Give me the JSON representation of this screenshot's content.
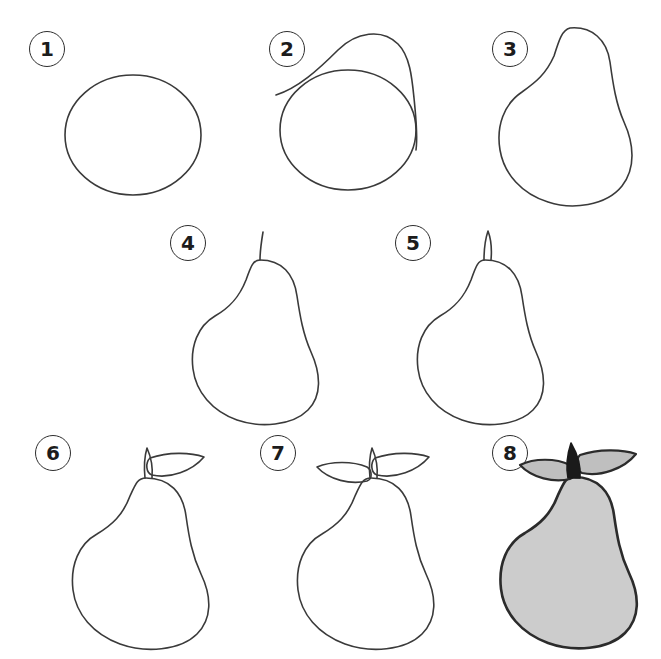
{
  "sheet": {
    "title": "How to Draw a Pear",
    "background_color": "#ffffff",
    "ink_color": "#3a3a3a",
    "fill_gray": "#cccccc",
    "leaf_gray": "#bfbfbf",
    "stem_dark": "#1a1a1a",
    "total_steps": 8,
    "columns_row1": 3,
    "columns_row2": 2,
    "columns_row3": 3
  },
  "steps": [
    {
      "number": "1",
      "name": "step-1",
      "description": "Draw a large circle for the body of the pear.",
      "elements": [
        "circle"
      ],
      "filled": "no"
    },
    {
      "number": "2",
      "name": "step-2",
      "description": "Add a rounded dome shape overlapping the top of the circle for the neck.",
      "elements": [
        "circle",
        "neck-dome"
      ],
      "filled": "no"
    },
    {
      "number": "3",
      "name": "step-3",
      "description": "Merge the two shapes into one smooth pear outline and erase guide lines.",
      "elements": [
        "pear-outline"
      ],
      "filled": "no"
    },
    {
      "number": "4",
      "name": "step-4",
      "description": "Draw a thin line rising from the top of the pear for the stem.",
      "elements": [
        "pear-outline",
        "stem-line"
      ],
      "filled": "no"
    },
    {
      "number": "5",
      "name": "step-5",
      "description": "Thicken the stem into a narrow outlined shape.",
      "elements": [
        "pear-outline",
        "stem-outline"
      ],
      "filled": "no"
    },
    {
      "number": "6",
      "name": "step-6",
      "description": "Add one pointed leaf to the right side of the stem.",
      "elements": [
        "pear-outline",
        "stem-outline",
        "leaf-right"
      ],
      "filled": "no"
    },
    {
      "number": "7",
      "name": "step-7",
      "description": "Add a second leaf on the left side of the stem.",
      "elements": [
        "pear-outline",
        "stem-outline",
        "leaf-right",
        "leaf-left"
      ],
      "filled": "no"
    },
    {
      "number": "8",
      "name": "step-8",
      "description": "Shade the pear gray, fill the leaves gray and darken the stem.",
      "elements": [
        "pear-outline",
        "stem-solid",
        "leaf-right",
        "leaf-left"
      ],
      "filled": "yes"
    }
  ]
}
